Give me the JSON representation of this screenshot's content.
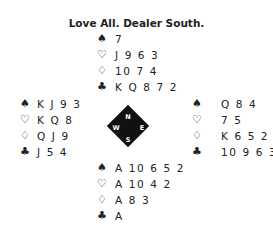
{
  "title": "Love All. Dealer South.",
  "suits": {
    "spades": "♠",
    "hearts": "♡",
    "diamonds": "♢",
    "clubs": "♣"
  },
  "hands": {
    "north": {
      "spades": "7",
      "hearts": "J 9 6 3",
      "diamonds": "10 7 4",
      "clubs": "K Q 8 7 2"
    },
    "west": {
      "spades": "K J 9 3",
      "hearts": "K Q 8",
      "diamonds": "Q J 9",
      "clubs": "J 5 4"
    },
    "east": {
      "spades": "Q 8 4",
      "hearts": "7 5",
      "diamonds": "K 6 5 2",
      "clubs": "10 9 6 3"
    },
    "south": {
      "spades": "A 10 6 5 2",
      "hearts": "A 10 4 2",
      "diamonds": "A 8 3",
      "clubs": "A"
    }
  },
  "compass": {
    "n": "N",
    "e": "E",
    "s": "S",
    "w": "W"
  }
}
